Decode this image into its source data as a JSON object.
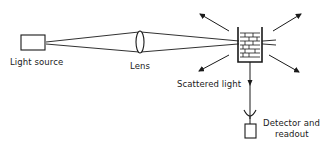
{
  "diagram": {
    "type": "optical light-scattering setup",
    "labels": {
      "light_source": "Light source",
      "lens": "Lens",
      "scattered_light": "Scattered light",
      "detector_line1": "Detector and",
      "detector_line2": "readout"
    },
    "components": [
      "Light source",
      "Lens",
      "Sample cell",
      "Detector and readout"
    ],
    "colors": {
      "ink": "#1a1a1a",
      "background": "#ffffff"
    }
  }
}
